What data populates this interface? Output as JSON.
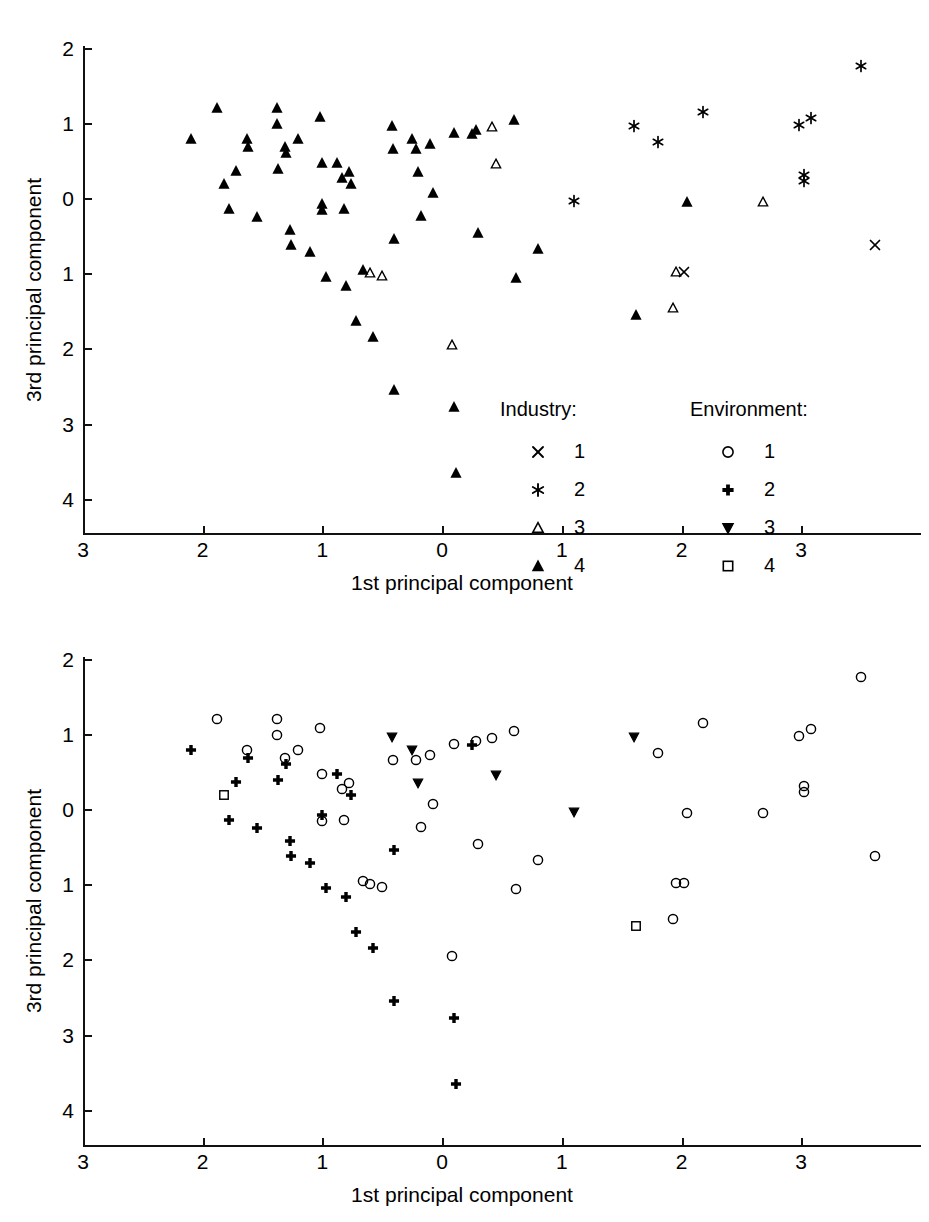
{
  "figure": {
    "panels": [
      {
        "id": "top",
        "symbol_scheme": "industry",
        "axis": {
          "xlabel": "1st principal component",
          "ylabel": "3rd principal component",
          "xticks": [
            "3",
            "2",
            "1",
            "0",
            "1",
            "2",
            "3"
          ],
          "xtick_values": [
            -3,
            -2,
            -1,
            0,
            1,
            2,
            3
          ],
          "yticks": [
            "2",
            "1",
            "0",
            "1",
            "2",
            "3",
            "4"
          ],
          "ytick_values": [
            2,
            1,
            0,
            -1,
            -2,
            -3,
            -4
          ],
          "xlim": [
            -3,
            3.7
          ],
          "ylim": [
            -4,
            2
          ]
        },
        "legend": {
          "groups": [
            {
              "title": "Industry:",
              "entries": [
                {
                  "symbol": "cross-x-marker",
                  "label": "1"
                },
                {
                  "symbol": "asterisk-marker",
                  "label": "2"
                },
                {
                  "symbol": "open-triangle-up-marker",
                  "label": "3"
                },
                {
                  "symbol": "filled-triangle-up-marker",
                  "label": "4"
                }
              ]
            },
            {
              "title": "Environment:",
              "entries": [
                {
                  "symbol": "open-circle-marker",
                  "label": "1"
                },
                {
                  "symbol": "filled-plus-marker",
                  "label": "2"
                },
                {
                  "symbol": "open-triangle-down-marker",
                  "label": "3"
                },
                {
                  "symbol": "open-square-marker",
                  "label": "4"
                }
              ]
            }
          ]
        }
      },
      {
        "id": "bottom",
        "symbol_scheme": "environment",
        "axis": {
          "xlabel": "1st principal component",
          "ylabel": "3rd principal component",
          "xticks": [
            "3",
            "2",
            "1",
            "0",
            "1",
            "2",
            "3"
          ],
          "xtick_values": [
            -3,
            -2,
            -1,
            0,
            1,
            2,
            3
          ],
          "yticks": [
            "2",
            "1",
            "0",
            "1",
            "2",
            "3",
            "4"
          ],
          "ytick_values": [
            2,
            1,
            0,
            -1,
            -2,
            -3,
            -4
          ],
          "xlim": [
            -3,
            3.7
          ],
          "ylim": [
            -4,
            2
          ]
        },
        "legend": null
      }
    ]
  },
  "chart_data": {
    "type": "scatter",
    "title": "",
    "subtitle": "",
    "xlabel": "1st principal component",
    "ylabel": "3rd principal component",
    "xlim": [
      -3,
      3.7
    ],
    "ylim": [
      -4,
      2
    ],
    "grid": false,
    "legend_position": "inside-lower-right-of-top-panel",
    "note": "Two panels show the same 79 observations; the top panel codes points by Industry class (symbols X, *, open-triangle, filled-triangle) and the bottom panel codes the same points by Environment class (open-circle, filled-plus, open-triangle-down, open-square). Axis tick labels are printed without minus signs; left of 0 on x and below 0 on y are negative.",
    "series": [
      {
        "name": "Industry 1",
        "symbol": "cross-x-marker",
        "panel": "top"
      },
      {
        "name": "Industry 2",
        "symbol": "asterisk-marker",
        "panel": "top"
      },
      {
        "name": "Industry 3",
        "symbol": "open-triangle-up-marker",
        "panel": "top"
      },
      {
        "name": "Industry 4",
        "symbol": "filled-triangle-up-marker",
        "panel": "top"
      },
      {
        "name": "Environment 1",
        "symbol": "open-circle-marker",
        "panel": "bottom"
      },
      {
        "name": "Environment 2",
        "symbol": "filled-plus-marker",
        "panel": "bottom"
      },
      {
        "name": "Environment 3",
        "symbol": "open-triangle-down-marker",
        "panel": "bottom"
      },
      {
        "name": "Environment 4",
        "symbol": "open-square-marker",
        "panel": "bottom"
      }
    ],
    "points": [
      {
        "x": -2.1,
        "y": 0.78,
        "industry": 4,
        "environment": 2
      },
      {
        "x": -1.88,
        "y": 1.2,
        "industry": 4,
        "environment": 1
      },
      {
        "x": -1.82,
        "y": 0.18,
        "industry": 4,
        "environment": 4
      },
      {
        "x": -1.78,
        "y": -0.14,
        "industry": 4,
        "environment": 2
      },
      {
        "x": -1.72,
        "y": 0.36,
        "industry": 4,
        "environment": 2
      },
      {
        "x": -1.63,
        "y": 0.78,
        "industry": 4,
        "environment": 1
      },
      {
        "x": -1.62,
        "y": 0.68,
        "industry": 4,
        "environment": 2
      },
      {
        "x": -1.55,
        "y": -0.25,
        "industry": 4,
        "environment": 2
      },
      {
        "x": -1.38,
        "y": 1.2,
        "industry": 4,
        "environment": 1
      },
      {
        "x": -1.38,
        "y": 0.98,
        "industry": 4,
        "environment": 1
      },
      {
        "x": -1.37,
        "y": 0.38,
        "industry": 4,
        "environment": 2
      },
      {
        "x": -1.31,
        "y": 0.68,
        "industry": 4,
        "environment": 1
      },
      {
        "x": -1.3,
        "y": 0.6,
        "industry": 4,
        "environment": 2
      },
      {
        "x": -1.27,
        "y": -0.43,
        "industry": 4,
        "environment": 2
      },
      {
        "x": -1.26,
        "y": -0.63,
        "industry": 4,
        "environment": 2
      },
      {
        "x": -1.2,
        "y": 0.78,
        "industry": 4,
        "environment": 1
      },
      {
        "x": -1.1,
        "y": -0.72,
        "industry": 4,
        "environment": 2
      },
      {
        "x": -1.02,
        "y": 1.08,
        "industry": 4,
        "environment": 1
      },
      {
        "x": -1.0,
        "y": 0.46,
        "industry": 4,
        "environment": 1
      },
      {
        "x": -1.0,
        "y": -0.08,
        "industry": 4,
        "environment": 2
      },
      {
        "x": -1.0,
        "y": -0.16,
        "industry": 4,
        "environment": 1
      },
      {
        "x": -0.97,
        "y": -1.05,
        "industry": 4,
        "environment": 2
      },
      {
        "x": -0.88,
        "y": 0.47,
        "industry": 4,
        "environment": 2
      },
      {
        "x": -0.84,
        "y": 0.26,
        "industry": 4,
        "environment": 1
      },
      {
        "x": -0.82,
        "y": -0.14,
        "industry": 4,
        "environment": 1
      },
      {
        "x": -0.8,
        "y": -1.17,
        "industry": 4,
        "environment": 2
      },
      {
        "x": -0.78,
        "y": 0.34,
        "industry": 4,
        "environment": 1
      },
      {
        "x": -0.76,
        "y": 0.18,
        "industry": 4,
        "environment": 2
      },
      {
        "x": -0.72,
        "y": -1.64,
        "industry": 4,
        "environment": 2
      },
      {
        "x": -0.66,
        "y": -0.96,
        "industry": 4,
        "environment": 1
      },
      {
        "x": -0.6,
        "y": -1.0,
        "industry": 3,
        "environment": 1
      },
      {
        "x": -0.58,
        "y": -1.85,
        "industry": 4,
        "environment": 2
      },
      {
        "x": -0.5,
        "y": -1.04,
        "industry": 3,
        "environment": 1
      },
      {
        "x": -0.42,
        "y": 0.96,
        "industry": 4,
        "environment": 3
      },
      {
        "x": -0.41,
        "y": 0.65,
        "industry": 4,
        "environment": 1
      },
      {
        "x": -0.4,
        "y": -0.55,
        "industry": 4,
        "environment": 2
      },
      {
        "x": -0.4,
        "y": -2.55,
        "industry": 4,
        "environment": 2
      },
      {
        "x": -0.25,
        "y": 0.78,
        "industry": 4,
        "environment": 3
      },
      {
        "x": -0.22,
        "y": 0.65,
        "industry": 4,
        "environment": 1
      },
      {
        "x": -0.2,
        "y": 0.35,
        "industry": 4,
        "environment": 3
      },
      {
        "x": -0.18,
        "y": -0.24,
        "industry": 4,
        "environment": 1
      },
      {
        "x": -0.1,
        "y": 0.72,
        "industry": 4,
        "environment": 1
      },
      {
        "x": -0.08,
        "y": 0.06,
        "industry": 4,
        "environment": 1
      },
      {
        "x": 0.08,
        "y": -1.95,
        "industry": 3,
        "environment": 1
      },
      {
        "x": 0.1,
        "y": 0.86,
        "industry": 4,
        "environment": 1
      },
      {
        "x": 0.1,
        "y": -2.78,
        "industry": 4,
        "environment": 2
      },
      {
        "x": 0.12,
        "y": -3.66,
        "industry": 4,
        "environment": 2
      },
      {
        "x": 0.25,
        "y": 0.85,
        "industry": 4,
        "environment": 2
      },
      {
        "x": 0.28,
        "y": 0.9,
        "industry": 4,
        "environment": 1
      },
      {
        "x": 0.3,
        "y": -0.46,
        "industry": 4,
        "environment": 1
      },
      {
        "x": 0.42,
        "y": 0.95,
        "industry": 3,
        "environment": 1
      },
      {
        "x": 0.45,
        "y": 0.45,
        "industry": 3,
        "environment": 3
      },
      {
        "x": 0.6,
        "y": 1.04,
        "industry": 4,
        "environment": 1
      },
      {
        "x": 0.62,
        "y": -1.06,
        "industry": 4,
        "environment": 1
      },
      {
        "x": 0.8,
        "y": -0.68,
        "industry": 4,
        "environment": 1
      },
      {
        "x": 1.1,
        "y": -0.04,
        "industry": 2,
        "environment": 3
      },
      {
        "x": 1.6,
        "y": 0.96,
        "industry": 2,
        "environment": 3
      },
      {
        "x": 1.62,
        "y": -1.56,
        "industry": 4,
        "environment": 4
      },
      {
        "x": 1.8,
        "y": 0.74,
        "industry": 2,
        "environment": 1
      },
      {
        "x": 1.93,
        "y": -1.46,
        "industry": 3,
        "environment": 1
      },
      {
        "x": 1.95,
        "y": -0.98,
        "industry": 3,
        "environment": 1
      },
      {
        "x": 2.02,
        "y": -0.98,
        "industry": 1,
        "environment": 1
      },
      {
        "x": 2.05,
        "y": -0.05,
        "industry": 4,
        "environment": 1
      },
      {
        "x": 2.18,
        "y": 1.14,
        "industry": 2,
        "environment": 1
      },
      {
        "x": 2.68,
        "y": -0.05,
        "industry": 3,
        "environment": 1
      },
      {
        "x": 2.98,
        "y": 0.97,
        "industry": 2,
        "environment": 1
      },
      {
        "x": 3.02,
        "y": 0.3,
        "industry": 2,
        "environment": 1
      },
      {
        "x": 3.02,
        "y": 0.22,
        "industry": 2,
        "environment": 1
      },
      {
        "x": 3.08,
        "y": 1.06,
        "industry": 2,
        "environment": 1
      },
      {
        "x": 3.5,
        "y": 1.75,
        "industry": 2,
        "environment": 1
      },
      {
        "x": 3.62,
        "y": -0.62,
        "industry": 1,
        "environment": 1
      }
    ]
  }
}
